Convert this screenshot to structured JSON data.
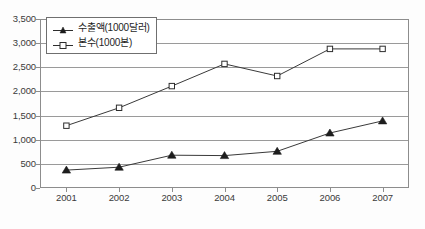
{
  "chart_data": {
    "type": "line",
    "title": "",
    "subtitle": "",
    "xlabel": "",
    "ylabel": "",
    "categories": [
      "2001",
      "2002",
      "2003",
      "2004",
      "2005",
      "2006",
      "2007"
    ],
    "x_tick_labels": [
      "2001",
      "2002",
      "2003",
      "2004",
      "2005",
      "2006",
      "2007"
    ],
    "y_tick_labels": [
      "3,500",
      "3,000",
      "2,500",
      "2,000",
      "1,500",
      "1,000",
      "500",
      "0"
    ],
    "y_tick_values": [
      3500,
      3000,
      2500,
      2000,
      1500,
      1000,
      500,
      0
    ],
    "ylim": [
      0,
      3500
    ],
    "y_tick_step": 500,
    "grid": true,
    "grid_axis": "y",
    "legend_position": "top-left-inside",
    "series": [
      {
        "name": "수출액(1000달러)",
        "marker": "filled-triangle",
        "values": [
          370,
          430,
          680,
          670,
          760,
          1140,
          1390
        ]
      },
      {
        "name": "본수(1000본)",
        "marker": "open-square",
        "values": [
          1290,
          1660,
          2110,
          2570,
          2320,
          2880,
          2880
        ]
      }
    ]
  },
  "legend": {
    "entries": [
      {
        "label": "수출액(1000달러)",
        "marker": "filled-triangle-marker"
      },
      {
        "label": "본수(1000본)",
        "marker": "open-square-marker"
      }
    ]
  },
  "colors": {
    "line": "#3a3a3a",
    "grid": "#9a9a9a",
    "frame": "#8d8d8d",
    "text": "#3a3a3a",
    "marker_fill_filled": "#1d1d1d",
    "marker_fill_open": "#ffffff",
    "background": "#ffffff"
  }
}
